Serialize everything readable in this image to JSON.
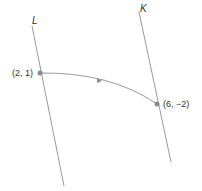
{
  "diagram": {
    "lines": [
      {
        "id": "L",
        "label": "L",
        "x1": 32,
        "y1": 26,
        "x2": 64,
        "y2": 186,
        "label_x": 32,
        "label_y": 24
      },
      {
        "id": "K",
        "label": "K",
        "x1": 139,
        "y1": 12,
        "x2": 171,
        "y2": 162,
        "label_x": 140,
        "label_y": 12
      }
    ],
    "points": [
      {
        "id": "start",
        "label": "(2, 1)",
        "cx": 40,
        "cy": 73,
        "label_x": 12,
        "label_y": 76
      },
      {
        "id": "end",
        "label": "(6, −2)",
        "cx": 157,
        "cy": 104,
        "label_x": 163,
        "label_y": 107
      }
    ],
    "curve": {
      "path": "M40,73 Q110,72 157,104",
      "arrow_x": 99,
      "arrow_y": 80,
      "direction": "left-to-right"
    },
    "colors": {
      "line": "#9a9a9a",
      "point": "#8a8a8a",
      "arrow": "#8a8a8a",
      "text": "#333333"
    }
  }
}
